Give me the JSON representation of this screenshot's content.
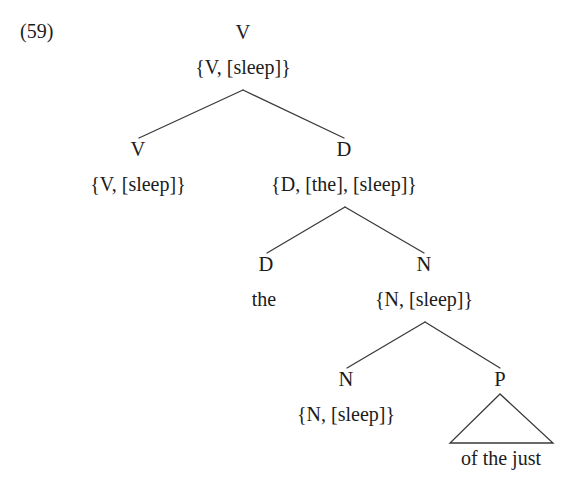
{
  "figure": {
    "example_number": "(59)",
    "ink_color": "#1c1c1c",
    "line_color": "#3a3a3a",
    "background_color": "#ffffff"
  },
  "tree": {
    "nodes": {
      "root": {
        "category": "V",
        "features": "{V, [sleep]}"
      },
      "v_left": {
        "category": "V",
        "features": "{V, [sleep]}"
      },
      "d_phrase": {
        "category": "D",
        "features": "{D, [the], [sleep]}"
      },
      "d_head": {
        "category": "D",
        "terminal": "the"
      },
      "n_phrase": {
        "category": "N",
        "features": "{N, [sleep]}"
      },
      "n_inner": {
        "category": "N",
        "features": "{N, [sleep]}"
      },
      "p_node": {
        "category": "P",
        "terminal": "of the just"
      }
    }
  }
}
